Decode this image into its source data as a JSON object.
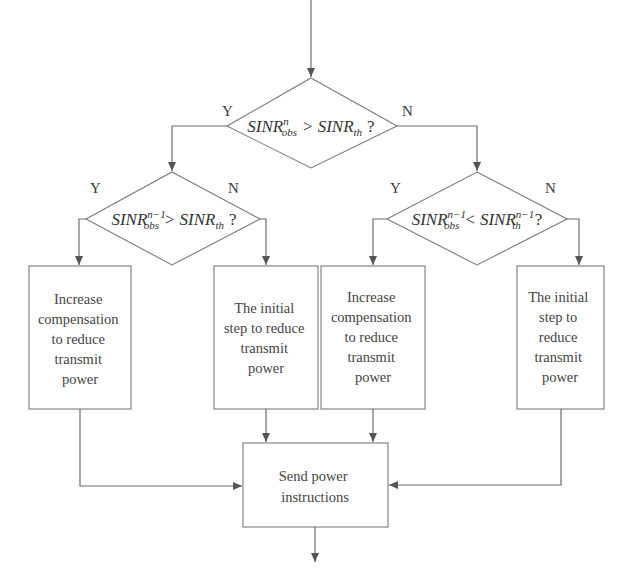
{
  "diagram": {
    "type": "flowchart",
    "colors": {
      "line": "#6e6e6e",
      "text": "#3a3a3a",
      "background": "#ffffff"
    },
    "decisions": [
      {
        "id": "d1",
        "base": "SINR",
        "sup": "n",
        "sub": "obs",
        "op": ">",
        "base2": "SINR",
        "sup2": "",
        "sub2": "th",
        "q": "?",
        "yes_label": "Y",
        "no_label": "N"
      },
      {
        "id": "d2",
        "base": "SINR",
        "sup": "n−1",
        "sub": "obs",
        "op": ">",
        "base2": "SINR",
        "sup2": "",
        "sub2": "th",
        "q": "?",
        "yes_label": "Y",
        "no_label": "N"
      },
      {
        "id": "d3",
        "base": "SINR",
        "sup": "n−1",
        "sub": "obs",
        "op": "<",
        "base2": "SINR",
        "sup2": "n−1",
        "sub2": "th",
        "q": "?",
        "yes_label": "Y",
        "no_label": "N"
      }
    ],
    "processes": [
      {
        "id": "p1",
        "lines": [
          "Increase",
          "compensation",
          "to reduce",
          "transmit",
          "power"
        ]
      },
      {
        "id": "p2",
        "lines": [
          "The initial",
          "step to reduce",
          "transmit",
          "power"
        ]
      },
      {
        "id": "p3",
        "lines": [
          "Increase",
          "compensation",
          "to reduce",
          "transmit",
          "power"
        ]
      },
      {
        "id": "p4",
        "lines": [
          "The initial",
          "step to",
          "reduce",
          "transmit",
          "power"
        ]
      },
      {
        "id": "p5",
        "lines": [
          "Send power",
          "instructions"
        ]
      }
    ],
    "edges": [
      {
        "from": "start",
        "to": "d1"
      },
      {
        "from": "d1",
        "to": "d2",
        "label": "Y"
      },
      {
        "from": "d1",
        "to": "d3",
        "label": "N"
      },
      {
        "from": "d2",
        "to": "p1",
        "label": "Y"
      },
      {
        "from": "d2",
        "to": "p2",
        "label": "N"
      },
      {
        "from": "d3",
        "to": "p3",
        "label": "Y"
      },
      {
        "from": "d3",
        "to": "p4",
        "label": "N"
      },
      {
        "from": "p1",
        "to": "p5"
      },
      {
        "from": "p2",
        "to": "p5"
      },
      {
        "from": "p3",
        "to": "p5"
      },
      {
        "from": "p4",
        "to": "p5"
      },
      {
        "from": "p5",
        "to": "end"
      }
    ]
  }
}
